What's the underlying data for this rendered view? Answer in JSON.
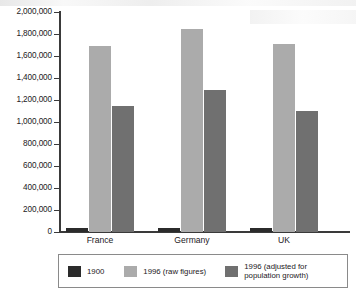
{
  "chart_data": {
    "type": "bar",
    "title": "",
    "xlabel": "",
    "ylabel": "",
    "categories": [
      "France",
      "Germany",
      "UK"
    ],
    "series": [
      {
        "name": "1900",
        "color": "#2b2b2b",
        "values": [
          35000,
          40000,
          32000
        ]
      },
      {
        "name": "1996 (raw figures)",
        "color": "#ababab",
        "values": [
          1690000,
          1845000,
          1710000
        ]
      },
      {
        "name": "1996 (adjusted for population growth)",
        "color": "#707070",
        "values": [
          1145000,
          1290000,
          1100000
        ]
      }
    ],
    "ylim": [
      0,
      2000000
    ],
    "ytick_step": 200000,
    "ytick_labels": [
      "2,000,000",
      "1,800,000",
      "1,600,000",
      "1,400,000",
      "1,200,000",
      "1,000,000",
      "800,000",
      "600,000",
      "400,000",
      "200,000",
      "0"
    ],
    "ytick_values": [
      2000000,
      1800000,
      1600000,
      1400000,
      1200000,
      1000000,
      800000,
      600000,
      400000,
      200000,
      0
    ],
    "grid": false,
    "legend_position": "bottom"
  },
  "legend": {
    "items": [
      {
        "label": "1900",
        "color": "#2b2b2b"
      },
      {
        "label": "1996 (raw figures)",
        "color": "#ababab"
      },
      {
        "label": "1996 (adjusted for\npopulation growth)",
        "color": "#707070"
      }
    ]
  },
  "colors": {
    "axis": "#3a3a3a",
    "text": "#23201c",
    "background": "#ffffff",
    "legend_border": "#8a8a8a"
  }
}
